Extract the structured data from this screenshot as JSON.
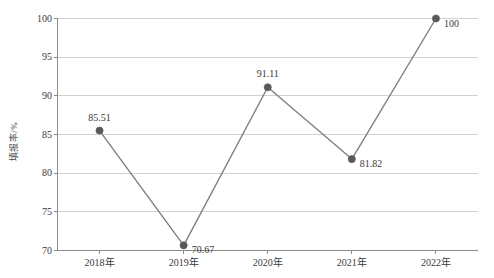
{
  "chart_data": {
    "type": "line",
    "title": "",
    "subtitle": "",
    "xlabel": "",
    "ylabel": "填报率/%",
    "categories": [
      "2018年",
      "2019年",
      "2020年",
      "2021年",
      "2022年"
    ],
    "values": [
      85.51,
      70.67,
      91.11,
      81.82,
      100
    ],
    "point_labels": [
      "85.51",
      "70.67",
      "91.11",
      "81.82",
      "100"
    ],
    "label_positions": [
      "above",
      "right",
      "above",
      "right",
      "right"
    ],
    "ylim": [
      70,
      100
    ],
    "yticks": [
      70,
      75,
      80,
      85,
      90,
      95,
      100
    ],
    "ytick_labels": [
      "70",
      "75",
      "80",
      "85",
      "90",
      "95",
      "100"
    ],
    "grid": true,
    "grid_axis": "y",
    "legend": false,
    "legend_position": "none",
    "series": [
      {
        "name": "填报率",
        "values": [
          85.51,
          70.67,
          91.11,
          81.82,
          100
        ]
      }
    ]
  },
  "style": {
    "line_color": "#808080",
    "marker_color": "#595959",
    "grid_color": "#d2d2d2",
    "axis_color": "#8a8a8a",
    "text_color": "#3a3a3a",
    "background": "#ffffff"
  }
}
